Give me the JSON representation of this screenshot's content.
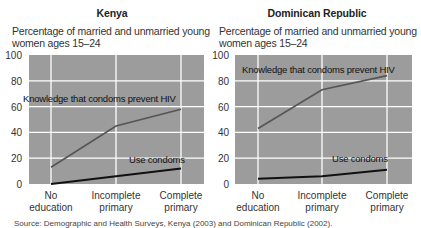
{
  "chart_data": [
    {
      "type": "line",
      "title": "Kenya",
      "subtitle": "Percentage of married and unmarried young women ages 15–24",
      "subtitle_lines": [
        "Percentage of married and unmarried young",
        "women ages 15–24"
      ],
      "categories": [
        "No education",
        "Incomplete primary",
        "Complete primary"
      ],
      "category_lines": [
        [
          "No",
          "education"
        ],
        [
          "Incomplete",
          "primary"
        ],
        [
          "Complete",
          "primary"
        ]
      ],
      "series": [
        {
          "name": "Knowledge that condoms prevent HIV",
          "values": [
            13,
            45,
            58
          ],
          "color": "#555555"
        },
        {
          "name": "Use condoms",
          "values": [
            0,
            6,
            12
          ],
          "color": "#111111"
        }
      ],
      "yticks": [
        0,
        20,
        40,
        60,
        80,
        100
      ],
      "ylim": [
        0,
        100
      ],
      "xlabel": "",
      "ylabel": "",
      "grid": true,
      "legend": "inline labels"
    },
    {
      "type": "line",
      "title": "Dominican Republic",
      "subtitle": "Percentage of married and unmarried young women ages 15–24",
      "subtitle_lines": [
        "Percentage of married and unmarried young",
        "women ages 15–24"
      ],
      "categories": [
        "No education",
        "Incomplete primary",
        "Complete primary"
      ],
      "category_lines": [
        [
          "No",
          "education"
        ],
        [
          "Incomplete",
          "primary"
        ],
        [
          "Complete",
          "primary"
        ]
      ],
      "series": [
        {
          "name": "Knowledge that condoms prevent HIV",
          "values": [
            43,
            73,
            84
          ],
          "color": "#555555"
        },
        {
          "name": "Use condoms",
          "values": [
            4,
            6,
            11
          ],
          "color": "#111111"
        }
      ],
      "yticks": [
        0,
        20,
        40,
        60,
        80,
        100
      ],
      "ylim": [
        0,
        100
      ],
      "xlabel": "",
      "ylabel": "",
      "grid": true,
      "legend": "inline labels"
    }
  ],
  "colors": {
    "plot_background": "#9c9c9c",
    "gridline": "#ffffff",
    "knowledge_line": "#555555",
    "use_line": "#111111"
  },
  "source": "Source: Demographic and Health Surveys, Kenya (2003) and Dominican Republic (2002)."
}
